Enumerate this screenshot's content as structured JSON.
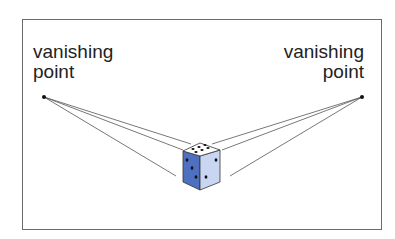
{
  "diagram": {
    "labels": {
      "left": {
        "line1": "vanishing",
        "line2": "point"
      },
      "right": {
        "line1": "vanishing",
        "line2": "point"
      }
    },
    "colors": {
      "frame": "#6a6a6a",
      "lines": "#555555",
      "cube_left_face": "#4f6fc0",
      "cube_right_face": "#c8d6f2",
      "cube_top_face": "#ffffff",
      "pips": "#111111"
    },
    "object": "dice (cube)"
  }
}
